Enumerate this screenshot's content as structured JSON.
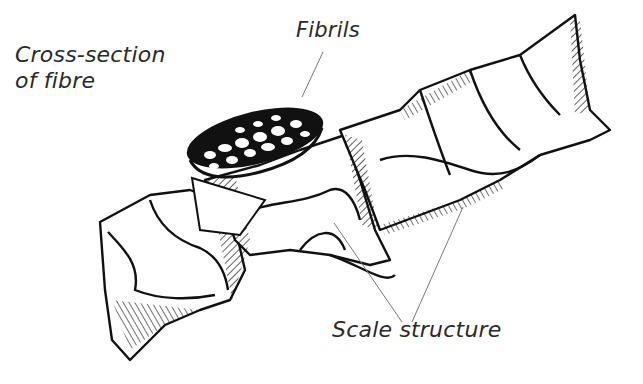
{
  "diagram": {
    "labels": {
      "cross_section_line1": "Cross-section",
      "cross_section_line2": "of fibre",
      "fibrils": "Fibrils",
      "scale_structure": "Scale structure"
    },
    "colors": {
      "ink": "#111111",
      "leader_line": "#777777",
      "label_text": "#2a2a2a",
      "background": "#ffffff"
    }
  }
}
